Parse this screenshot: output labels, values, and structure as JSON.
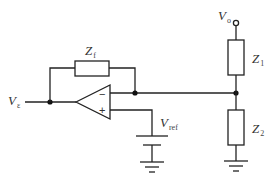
{
  "diagram": {
    "type": "circuit",
    "components": {
      "feedback_impedance": {
        "symbol": "Z",
        "subscript": "f"
      },
      "z1": {
        "symbol": "Z",
        "subscript": "1"
      },
      "z2": {
        "symbol": "Z",
        "subscript": "2"
      },
      "op_amp": {
        "inverting_sign": "−",
        "noninverting_sign": "+"
      },
      "reference_source": {
        "symbol": "V",
        "subscript": "ref"
      }
    },
    "terminals": {
      "input": {
        "symbol": "V",
        "subscript": "ε"
      },
      "output_supply": {
        "symbol": "V",
        "subscript": "o"
      }
    }
  }
}
